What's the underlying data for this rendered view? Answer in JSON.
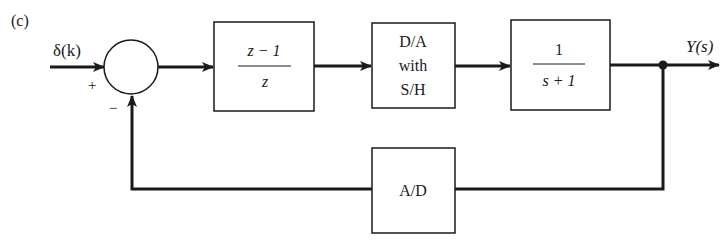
{
  "figure": {
    "label": "(c)",
    "input_signal": "δ(k)",
    "output_signal": "Y(s)",
    "summing_junction": {
      "plus_sign": "+",
      "minus_sign": "−"
    },
    "blocks": [
      {
        "name": "controller",
        "numerator": "z − 1",
        "denominator": "z"
      },
      {
        "name": "dac",
        "lines": [
          "D/A",
          "with",
          "S/H"
        ]
      },
      {
        "name": "plant",
        "numerator": "1",
        "denominator": "s + 1"
      },
      {
        "name": "adc",
        "label": "A/D"
      }
    ]
  },
  "colors": {
    "line": "#1a1a1a",
    "background": "#ffffff"
  }
}
